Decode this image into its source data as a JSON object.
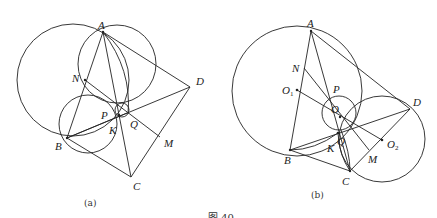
{
  "figure": {
    "caption": "图 40",
    "panels": [
      {
        "id": "a",
        "label": "(a)",
        "points": {
          "A": {
            "label": "A",
            "x": 103,
            "y": 32
          },
          "N": {
            "label": "N",
            "x": 85,
            "y": 80
          },
          "D": {
            "label": "D",
            "x": 190,
            "y": 87
          },
          "P": {
            "label": "P",
            "x": 118,
            "y": 115
          },
          "Q": {
            "label": "Q",
            "x": 127,
            "y": 113
          },
          "K": {
            "label": "K",
            "x": 118,
            "y": 116
          },
          "B": {
            "label": "B",
            "x": 67,
            "y": 138
          },
          "C": {
            "label": "C",
            "x": 131,
            "y": 177
          },
          "M": {
            "label": "M",
            "x": 160,
            "y": 137
          }
        }
      },
      {
        "id": "b",
        "label": "(b)",
        "points": {
          "A": {
            "label": "A",
            "x": 311,
            "y": 31
          },
          "N": {
            "label": "N",
            "x": 304,
            "y": 68
          },
          "O1": {
            "label": "O",
            "sub": "1",
            "x": 297,
            "y": 90
          },
          "P": {
            "label": "P",
            "x": 334,
            "y": 95
          },
          "O": {
            "label": "O",
            "x": 337,
            "y": 112
          },
          "D": {
            "label": "D",
            "x": 410,
            "y": 109
          },
          "Q": {
            "label": "Q",
            "x": 341,
            "y": 130
          },
          "K": {
            "label": "K",
            "x": 338,
            "y": 133
          },
          "O2": {
            "label": "O",
            "sub": "2",
            "x": 382,
            "y": 140
          },
          "M": {
            "label": "M",
            "x": 369,
            "y": 150
          },
          "B": {
            "label": "B",
            "x": 290,
            "y": 150
          },
          "C": {
            "label": "C",
            "x": 350,
            "y": 171
          }
        }
      }
    ]
  }
}
